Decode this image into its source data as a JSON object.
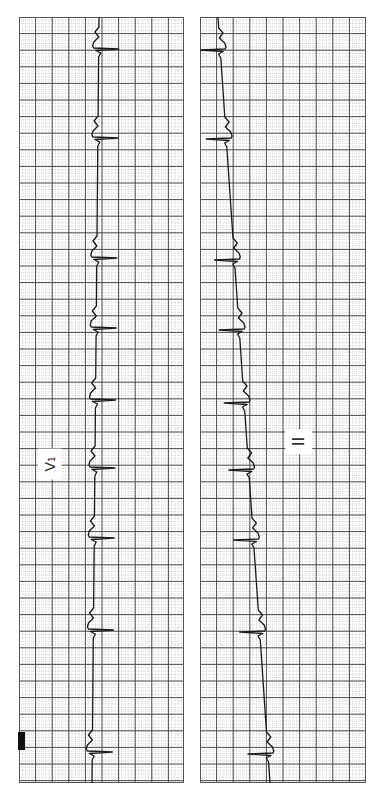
{
  "figure": {
    "type": "ecg-rhythm-strips",
    "orientation": "rotated-90"
  },
  "grid": {
    "major_spacing_px": 16.6,
    "minor_spacing_px": 3.32,
    "major_color": "#3a3a3a",
    "minor_color": "#b5b5b5"
  },
  "strips": [
    {
      "id": "left",
      "lead_label": "V₁",
      "trace_color": "#1a1a1a",
      "baseline_x_top": 80,
      "baseline_x_bottom": 73,
      "qrs_direction": "right",
      "qrs_positions_y": [
        32,
        121,
        241,
        311,
        383,
        451,
        521,
        613,
        735
      ]
    },
    {
      "id": "right",
      "lead_label": "II",
      "trace_color": "#1a1a1a",
      "baseline_x_top": 18,
      "baseline_x_bottom": 70,
      "qrs_direction": "left",
      "qrs_positions_y": [
        33,
        122,
        243,
        313,
        386,
        453,
        523,
        615,
        737
      ]
    }
  ],
  "calibration_mark": {
    "color": "#111111"
  }
}
